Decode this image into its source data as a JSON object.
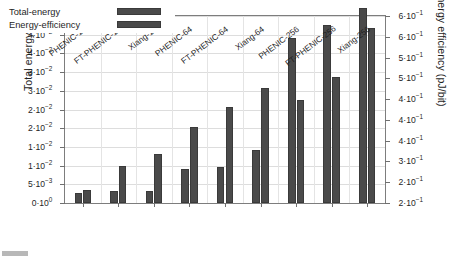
{
  "chart_data": {
    "type": "bar",
    "title": "",
    "subtitle": "",
    "xlabel": "",
    "ylabel": "Total energy (J)",
    "y2label": "Energy efficiency (pJ/bit)",
    "grid": true,
    "legend_position": "upper-left",
    "categories": [
      "PHENIC-16",
      "FT-PHENIC-16",
      "Xiang-16",
      "PHENIC-64",
      "FT-PHENIC-64",
      "Xiang-64",
      "PHENIC-256",
      "FT-PHENIC-256",
      "Xiang-256"
    ],
    "series": [
      {
        "name": "Total-energy",
        "axis": "left",
        "unit": "J",
        "color": "#4a4a4a",
        "values": [
          0.0028,
          0.0031,
          0.0031,
          0.009,
          0.0095,
          0.0143,
          0.0442,
          0.0476,
          0.0522
        ]
      },
      {
        "name": "Energy-efficiency",
        "axis": "right",
        "unit": "pJ/bit",
        "color": "#4a4a4a",
        "values": [
          0.277,
          0.33,
          0.355,
          0.413,
          0.455,
          0.497,
          0.47,
          0.52,
          0.624
        ]
      }
    ],
    "ylim": [
      0,
      0.05
    ],
    "y2lim": [
      0.25,
      0.65
    ],
    "yticks": [
      0.0,
      0.005,
      0.01,
      0.015,
      0.02,
      0.025,
      0.03,
      0.035,
      0.04,
      0.045,
      0.05
    ],
    "ytick_labels": [
      {
        "mantissa": "0",
        "exp": "0"
      },
      {
        "mantissa": "5",
        "exp": "-3"
      },
      {
        "mantissa": "1",
        "exp": "-2"
      },
      {
        "mantissa": "1",
        "exp": "-2"
      },
      {
        "mantissa": "2",
        "exp": "-2"
      },
      {
        "mantissa": "2",
        "exp": "-2"
      },
      {
        "mantissa": "3",
        "exp": "-2"
      },
      {
        "mantissa": "3",
        "exp": "-2"
      },
      {
        "mantissa": "4",
        "exp": "-2"
      },
      {
        "mantissa": "4",
        "exp": "-2"
      },
      {
        "mantissa": "5",
        "exp": "-2"
      }
    ],
    "y2ticks": [
      0.25,
      0.3,
      0.35,
      0.4,
      0.45,
      0.5,
      0.55,
      0.6,
      0.65
    ],
    "y2tick_labels": [
      {
        "mantissa": "2",
        "exp": "-1"
      },
      {
        "mantissa": "2",
        "exp": "-1"
      },
      {
        "mantissa": "3",
        "exp": "-1"
      },
      {
        "mantissa": "4",
        "exp": "-1"
      },
      {
        "mantissa": "4",
        "exp": "-1"
      },
      {
        "mantissa": "4",
        "exp": "-1"
      },
      {
        "mantissa": "5",
        "exp": "-1"
      },
      {
        "mantissa": "5",
        "exp": "-1"
      },
      {
        "mantissa": "6",
        "exp": "-1"
      },
      {
        "mantissa": "6",
        "exp": "-1"
      }
    ],
    "y2tick_positions": [
      0.0,
      0.1111,
      0.2222,
      0.3333,
      0.4444,
      0.5556,
      0.6667,
      0.7778,
      0.8889,
      1.0
    ]
  },
  "legend": {
    "entries": [
      {
        "label": "Total-energy"
      },
      {
        "label": "Energy-efficiency"
      }
    ]
  },
  "axes": {
    "left_title": "Total energy (J)",
    "right_title": "Energy efficiency (pJ/bit)"
  }
}
